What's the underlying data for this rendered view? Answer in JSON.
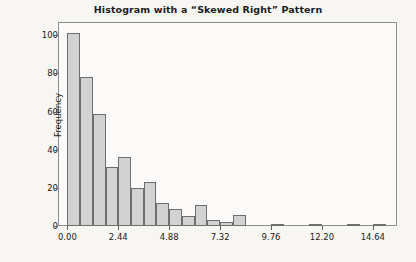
{
  "chart_data": {
    "type": "bar",
    "title": "Histogram with a “Skewed Right” Pattern",
    "xlabel": "",
    "ylabel": "Frequency",
    "xlim": [
      -0.45,
      15.8
    ],
    "ylim": [
      0,
      107
    ],
    "grid": false,
    "legend": null,
    "bin_width": 0.61,
    "x_tick_labels": [
      "0.00",
      "2.44",
      "4.88",
      "7.32",
      "9.76",
      "12.20",
      "14.64"
    ],
    "x_tick_values": [
      0.0,
      2.44,
      4.88,
      7.32,
      9.76,
      12.2,
      14.64
    ],
    "y_tick_labels": [
      "0",
      "20",
      "40",
      "60",
      "80",
      "100"
    ],
    "y_tick_values": [
      0,
      20,
      40,
      60,
      80,
      100
    ],
    "bin_starts": [
      0.0,
      0.61,
      1.22,
      1.83,
      2.44,
      3.05,
      3.66,
      4.27,
      4.88,
      5.49,
      6.1,
      6.71,
      7.32,
      7.93,
      8.54,
      9.76,
      11.59,
      13.42,
      14.64
    ],
    "categories": [
      "0.00",
      "0.61",
      "1.22",
      "1.83",
      "2.44",
      "3.05",
      "3.66",
      "4.27",
      "4.88",
      "5.49",
      "6.10",
      "6.71",
      "7.32",
      "7.93",
      "8.54",
      "9.76",
      "11.59",
      "13.42",
      "14.64"
    ],
    "values": [
      101,
      78,
      59,
      31,
      36,
      20,
      23,
      12,
      9,
      5,
      11,
      3,
      2,
      6,
      0,
      1,
      1,
      1,
      1
    ]
  },
  "style": {
    "bar_fill": "#d2d2d2",
    "bar_stroke": "#6e6e6e",
    "frame_stroke": "#8d8d8d",
    "text_color": "#1c1c1c",
    "background": "#f7f6f3",
    "plot_background": "#fbfaf8"
  }
}
